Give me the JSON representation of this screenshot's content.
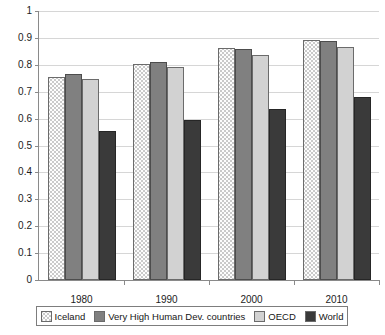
{
  "chart_data": {
    "type": "bar",
    "title": "",
    "xlabel": "",
    "ylabel": "",
    "categories": [
      "1980",
      "1990",
      "2000",
      "2010"
    ],
    "series": [
      {
        "name": "Iceland",
        "values": [
          0.755,
          0.803,
          0.861,
          0.894
        ],
        "color": "#fdfdfd",
        "pattern": "dotted"
      },
      {
        "name": "Very High Human Dev. countries",
        "values": [
          0.765,
          0.81,
          0.857,
          0.888
        ],
        "color": "#808080",
        "pattern": "solid"
      },
      {
        "name": "OECD",
        "values": [
          0.747,
          0.792,
          0.838,
          0.868
        ],
        "color": "#d2d2d2",
        "pattern": "solid"
      },
      {
        "name": "World",
        "values": [
          0.555,
          0.594,
          0.635,
          0.682
        ],
        "color": "#3a3a3a",
        "pattern": "solid"
      }
    ],
    "ylim": [
      0,
      1
    ],
    "ytick_labels": [
      "1",
      "0.9",
      "0.8",
      "0.7",
      "0.6",
      "0.5",
      "0.4",
      "0.3",
      "0.2",
      "0.1",
      "0"
    ],
    "ytick_values": [
      1,
      0.9,
      0.8,
      0.7,
      0.6,
      0.5,
      0.4,
      0.3,
      0.2,
      0.1,
      0
    ],
    "grid": true,
    "legend_position": "bottom"
  },
  "legend": {
    "entries": [
      {
        "label": "Iceland"
      },
      {
        "label": "Very High Human Dev. countries"
      },
      {
        "label": "OECD"
      },
      {
        "label": "World"
      }
    ]
  }
}
